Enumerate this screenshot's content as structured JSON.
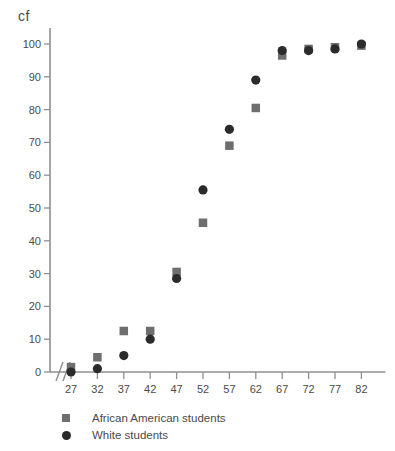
{
  "chart_data": {
    "type": "scatter",
    "title": "",
    "xlabel": "",
    "ylabel": "cf",
    "x": [
      27,
      32,
      37,
      42,
      47,
      52,
      57,
      62,
      67,
      72,
      77,
      82
    ],
    "xticklabels": [
      "27",
      "32",
      "37",
      "42",
      "47",
      "52",
      "57",
      "62",
      "67",
      "72",
      "77",
      "82"
    ],
    "yticklabels": [
      "0",
      "10",
      "20",
      "30",
      "40",
      "50",
      "60",
      "70",
      "80",
      "90",
      "100"
    ],
    "ylim": [
      0,
      100
    ],
    "ytick_step": 10,
    "grid": false,
    "x_axis_break": true,
    "x_axis_break_symbol": "//",
    "legend_position": "below-left",
    "series": [
      {
        "name": "African American students",
        "marker": "square",
        "color": "#6e6e6e",
        "values": [
          1.5,
          4.5,
          12.5,
          12.5,
          30.5,
          45.5,
          69,
          80.5,
          96.5,
          98.5,
          99,
          99.5
        ]
      },
      {
        "name": "White students",
        "marker": "circle",
        "color": "#2b2b2b",
        "values": [
          0,
          1,
          5,
          10,
          28.5,
          55.5,
          74,
          89,
          98,
          98,
          98.5,
          100
        ]
      }
    ]
  },
  "legend": {
    "items": [
      {
        "label": "African American students",
        "marker": "square-marker",
        "color": "#6e6e6e"
      },
      {
        "label": "White students",
        "marker": "circle-marker",
        "color": "#2b2b2b"
      }
    ]
  },
  "axes": {
    "y_title": "cf"
  }
}
